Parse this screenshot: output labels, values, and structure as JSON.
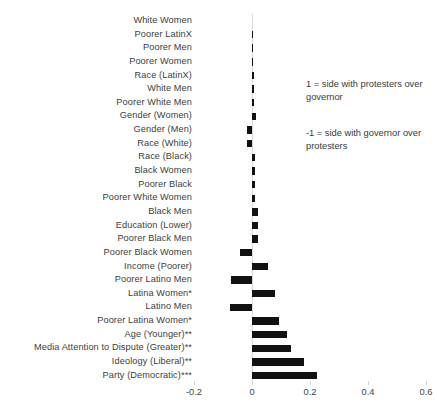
{
  "chart_data": {
    "type": "bar",
    "orientation": "horizontal",
    "title": "",
    "xlabel": "",
    "ylabel": "",
    "xlim": [
      -0.2,
      0.6
    ],
    "xticks": [
      "-0.2",
      "0",
      "0.2",
      "0.4",
      "0.6"
    ],
    "xtick_values": [
      -0.2,
      0,
      0.2,
      0.4,
      0.6
    ],
    "grid": false,
    "legend": "none",
    "bar_color": "#111111",
    "zero_line_color": "#d9d9d9",
    "categories": [
      "White Women",
      "Poorer LatinX",
      "Poorer Men",
      "Poorer Women",
      "Race (LatinX)",
      "White Men",
      "Poorer White Men",
      "Gender (Women)",
      "Gender (Men)",
      "Race (White)",
      "Race (Black)",
      "Black Women",
      "Poorer Black",
      "Poorer White Women",
      "Black Men",
      "Education (Lower)",
      "Poorer Black Men",
      "Poorer Black Women",
      "Income (Poorer)",
      "Poorer Latino Men",
      "Latina Women*",
      "Latino Men",
      "Poorer Latina Women*",
      "Age (Younger)**",
      "Media Attention to Dispute (Greater)**",
      "Ideology (Liberal)**",
      "Party (Democratic)***"
    ],
    "values": [
      0.0,
      0.004,
      0.005,
      0.005,
      0.006,
      0.007,
      0.007,
      0.014,
      -0.017,
      -0.017,
      0.012,
      0.012,
      0.01,
      0.01,
      0.022,
      0.021,
      0.022,
      -0.041,
      0.055,
      -0.072,
      0.079,
      -0.077,
      0.094,
      0.122,
      0.135,
      0.178,
      0.225
    ]
  },
  "annotations": {
    "positive_note": "1 = side with protesters over governor",
    "negative_note": "-1 = side with governor over protesters"
  },
  "caption": {
    "text": ""
  }
}
